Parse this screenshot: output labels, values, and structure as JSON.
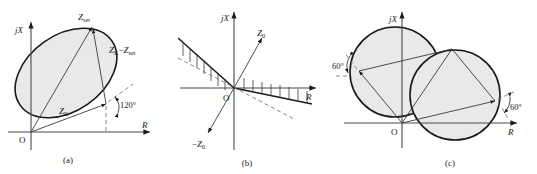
{
  "figure": {
    "name": "impedance-relay-characteristic-figure",
    "background_color": "#ffffff",
    "region_fill_color": "#e9e9e9",
    "line_color": "#1a1a1a",
    "axis_color": "#4a4a4a",
    "dashed_color": "#777777"
  },
  "axes": {
    "imaginary_label": "jX",
    "real_label": "R",
    "origin_label": "O"
  },
  "panels": [
    {
      "id": "a",
      "caption": "(a)",
      "shape": "tilted ellipse through origin",
      "vectors": [
        {
          "name": "Z-set-vector",
          "label_main": "Z",
          "label_sub": "set"
        },
        {
          "name": "Zk-vector",
          "label_main": "Z",
          "label_sub": "K"
        },
        {
          "name": "difference-vector",
          "label_main": "Z",
          "label_sub": "K",
          "label_operator": "−",
          "label_main2": "Z",
          "label_sub2": "set"
        }
      ],
      "angle_label": "120°"
    },
    {
      "id": "b",
      "caption": "(b)",
      "shape": "two hatched straight boundary lines through origin",
      "vectors": [
        {
          "name": "Z0-vector",
          "label_main": "Z",
          "label_sub": "0"
        },
        {
          "name": "negative-Z0-vector",
          "label_prefix": "−",
          "label_main": "Z",
          "label_sub": "0"
        }
      ]
    },
    {
      "id": "c",
      "caption": "(c)",
      "shape": "two overlapping circles with inscribed parallelogram",
      "angle_labels": [
        "60°",
        "60°"
      ]
    }
  ]
}
